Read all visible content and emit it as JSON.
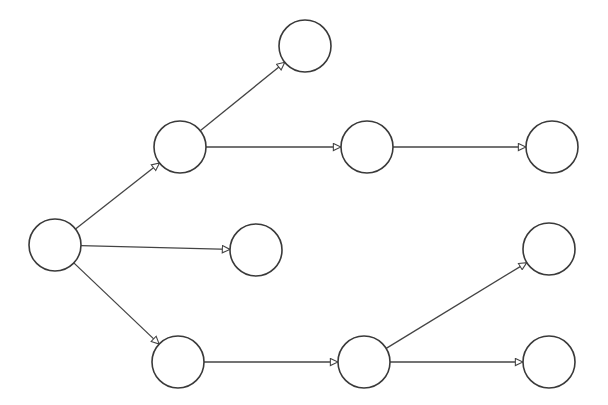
{
  "diagram": {
    "type": "directed-tree",
    "colors": {
      "stroke": "#3a3a3a",
      "edge": "#444444",
      "fill": "#ffffff",
      "background": "#ffffff"
    },
    "node_radius": 26,
    "nodes": [
      {
        "id": "n0",
        "label": "",
        "x": 55,
        "y": 245
      },
      {
        "id": "n1",
        "label": "",
        "x": 180,
        "y": 147
      },
      {
        "id": "n2",
        "label": "",
        "x": 256,
        "y": 250
      },
      {
        "id": "n3",
        "label": "",
        "x": 178,
        "y": 362
      },
      {
        "id": "n4",
        "label": "",
        "x": 305,
        "y": 46
      },
      {
        "id": "n5",
        "label": "",
        "x": 367,
        "y": 147
      },
      {
        "id": "n6",
        "label": "",
        "x": 552,
        "y": 147
      },
      {
        "id": "n7",
        "label": "",
        "x": 364,
        "y": 362
      },
      {
        "id": "n8",
        "label": "",
        "x": 549,
        "y": 249
      },
      {
        "id": "n9",
        "label": "",
        "x": 549,
        "y": 362
      }
    ],
    "edges": [
      {
        "from": "n0",
        "to": "n1"
      },
      {
        "from": "n0",
        "to": "n2"
      },
      {
        "from": "n0",
        "to": "n3"
      },
      {
        "from": "n1",
        "to": "n4"
      },
      {
        "from": "n1",
        "to": "n5"
      },
      {
        "from": "n5",
        "to": "n6"
      },
      {
        "from": "n3",
        "to": "n7"
      },
      {
        "from": "n7",
        "to": "n8"
      },
      {
        "from": "n7",
        "to": "n9"
      }
    ],
    "arrowhead": "open-triangle"
  }
}
